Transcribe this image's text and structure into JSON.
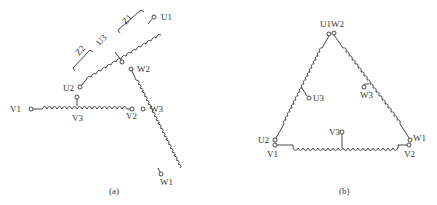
{
  "figure_a": {
    "caption": "(a)",
    "labels": {
      "U1": "U1",
      "U2": "U2",
      "U3": "U3",
      "V1": "V1",
      "V2": "V2",
      "V3": "V3",
      "W1": "W1",
      "W2": "W2",
      "W3": "W3",
      "Z1": "Z1",
      "Z2": "Z2"
    }
  },
  "figure_b": {
    "caption": "(b)",
    "labels": {
      "U1W2": "U1W2",
      "U2": "U2",
      "U3": "U3",
      "V1": "V1",
      "V2": "V2",
      "V3": "V3",
      "W1": "W1",
      "W3": "W3"
    }
  },
  "colors": {
    "line": "#333333",
    "background": "#ffffff"
  }
}
